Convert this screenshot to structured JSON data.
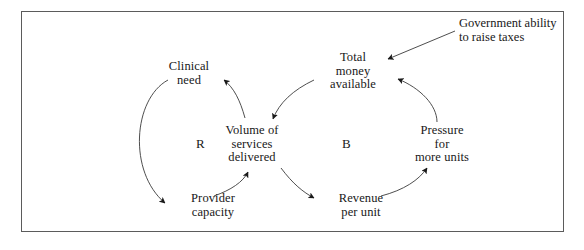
{
  "diagram": {
    "type": "causal-loop-diagram",
    "border_color": "#5b5b5b",
    "text_color": "#181818",
    "background": "#ffffff",
    "nodes": [
      {
        "id": "clinical-need",
        "lines": [
          "Clinical",
          "need"
        ]
      },
      {
        "id": "total-money",
        "lines": [
          "Total",
          "money",
          "available"
        ]
      },
      {
        "id": "volume",
        "lines": [
          "Volume of",
          "services",
          "delivered"
        ]
      },
      {
        "id": "pressure",
        "lines": [
          "Pressure",
          "for",
          "more units"
        ]
      },
      {
        "id": "provider",
        "lines": [
          "Provider",
          "capacity"
        ]
      },
      {
        "id": "revenue",
        "lines": [
          "Revenue",
          "per unit"
        ]
      }
    ],
    "loop_labels": [
      {
        "id": "reinforcing",
        "label": "R"
      },
      {
        "id": "balancing",
        "label": "B"
      }
    ],
    "external_inputs": [
      {
        "id": "government",
        "lines": [
          "Government ability",
          "to raise taxes"
        ]
      }
    ],
    "links": [
      {
        "from": "volume",
        "to": "clinical-need"
      },
      {
        "from": "clinical-need",
        "to": "provider"
      },
      {
        "from": "provider",
        "to": "volume"
      },
      {
        "from": "volume",
        "to": "revenue"
      },
      {
        "from": "revenue",
        "to": "pressure"
      },
      {
        "from": "pressure",
        "to": "total-money"
      },
      {
        "from": "total-money",
        "to": "volume"
      },
      {
        "from": "government",
        "to": "total-money"
      }
    ]
  }
}
